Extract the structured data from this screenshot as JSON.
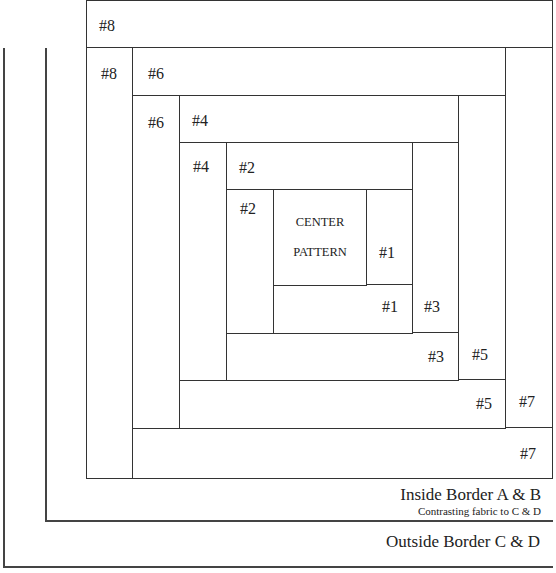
{
  "diagram": {
    "type": "log-cabin-quilt-block",
    "pieces": {
      "p8_top": "#8",
      "p8_left": "#8",
      "p6_top": "#6",
      "p6_left": "#6",
      "p4_top": "#4",
      "p4_left": "#4",
      "p2_top": "#2",
      "p2_left": "#2",
      "center_line1": "CENTER",
      "center_line2": "PATTERN",
      "p1_right": "#1",
      "p1_bottom": "#1",
      "p3_right": "#3",
      "p3_bottom": "#3",
      "p5_right": "#5",
      "p5_bottom": "#5",
      "p7_right": "#7",
      "p7_bottom": "#7"
    },
    "borders": {
      "inside_title": "Inside Border A & B",
      "inside_note": "Contrasting fabric to C & D",
      "outside_title": "Outside Border C & D"
    },
    "colors": {
      "line": "#333333",
      "background": "#ffffff",
      "text": "#222222"
    }
  }
}
